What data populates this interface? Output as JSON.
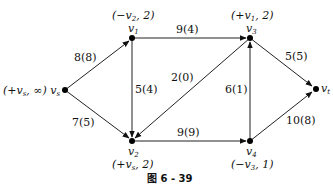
{
  "diagram": {
    "type": "network-flow",
    "caption": "图 6 - 39",
    "nodes": [
      {
        "id": "vs",
        "name": "v_s",
        "label": "(+v_s, ∞)",
        "x": 65,
        "y": 90
      },
      {
        "id": "v1",
        "name": "v_1",
        "label": "(−v_2, 2)",
        "x": 132,
        "y": 38
      },
      {
        "id": "v3",
        "name": "v_3",
        "label": "(+v_1, 2)",
        "x": 250,
        "y": 38
      },
      {
        "id": "vt",
        "name": "v_t",
        "label": "",
        "x": 316,
        "y": 89
      },
      {
        "id": "v2",
        "name": "v_2",
        "label": "(+v_s, 2)",
        "x": 132,
        "y": 141
      },
      {
        "id": "v4",
        "name": "v_4",
        "label": "(−v_3, 1)",
        "x": 250,
        "y": 141
      }
    ],
    "edges": [
      {
        "from": "vs",
        "to": "v1",
        "label": "8(8)",
        "capacity": 8,
        "flow": 8
      },
      {
        "from": "vs",
        "to": "v2",
        "label": "7(5)",
        "capacity": 7,
        "flow": 5
      },
      {
        "from": "v1",
        "to": "v3",
        "label": "9(4)",
        "capacity": 9,
        "flow": 4
      },
      {
        "from": "v1",
        "to": "v2",
        "label": "5(4)",
        "capacity": 5,
        "flow": 4
      },
      {
        "from": "v3",
        "to": "v2",
        "label": "2(0)",
        "capacity": 2,
        "flow": 0
      },
      {
        "from": "v2",
        "to": "v4",
        "label": "9(9)",
        "capacity": 9,
        "flow": 9
      },
      {
        "from": "v4",
        "to": "v3",
        "label": "6(1)",
        "capacity": 6,
        "flow": 1
      },
      {
        "from": "v3",
        "to": "vt",
        "label": "5(5)",
        "capacity": 5,
        "flow": 5
      },
      {
        "from": "v4",
        "to": "vt",
        "label": "10(8)",
        "capacity": 10,
        "flow": 8
      }
    ]
  },
  "text": {
    "vs_label": "(+v",
    "vs_label_sub": "s",
    "vs_label_tail": ", ∞) v",
    "vs_name_sub": "s",
    "v1_label": "(−v",
    "v1_label_sub": "2",
    "v1_label_tail": ", 2)",
    "v1_name": "v",
    "v1_name_sub": "1",
    "v3_label": "(+v",
    "v3_label_sub": "1",
    "v3_label_tail": ", 2)",
    "v3_name": "v",
    "v3_name_sub": "3",
    "vt_name": "v",
    "vt_name_sub": "t",
    "v2_name": "v",
    "v2_name_sub": "2",
    "v2_label": "(+v",
    "v2_label_sub": "s",
    "v2_label_tail": ", 2)",
    "v4_name": "v",
    "v4_name_sub": "4",
    "v4_label": "(−v",
    "v4_label_sub": "3",
    "v4_label_tail": ", 1)",
    "e_vs_v1": "8(8)",
    "e_vs_v2": "7(5)",
    "e_v1_v3": "9(4)",
    "e_v1_v2": "5(4)",
    "e_v3_v2": "2(0)",
    "e_v2_v4": "9(9)",
    "e_v4_v3": "6(1)",
    "e_v3_vt": "5(5)",
    "e_v4_vt": "10(8)",
    "caption": "图 6 - 39"
  }
}
